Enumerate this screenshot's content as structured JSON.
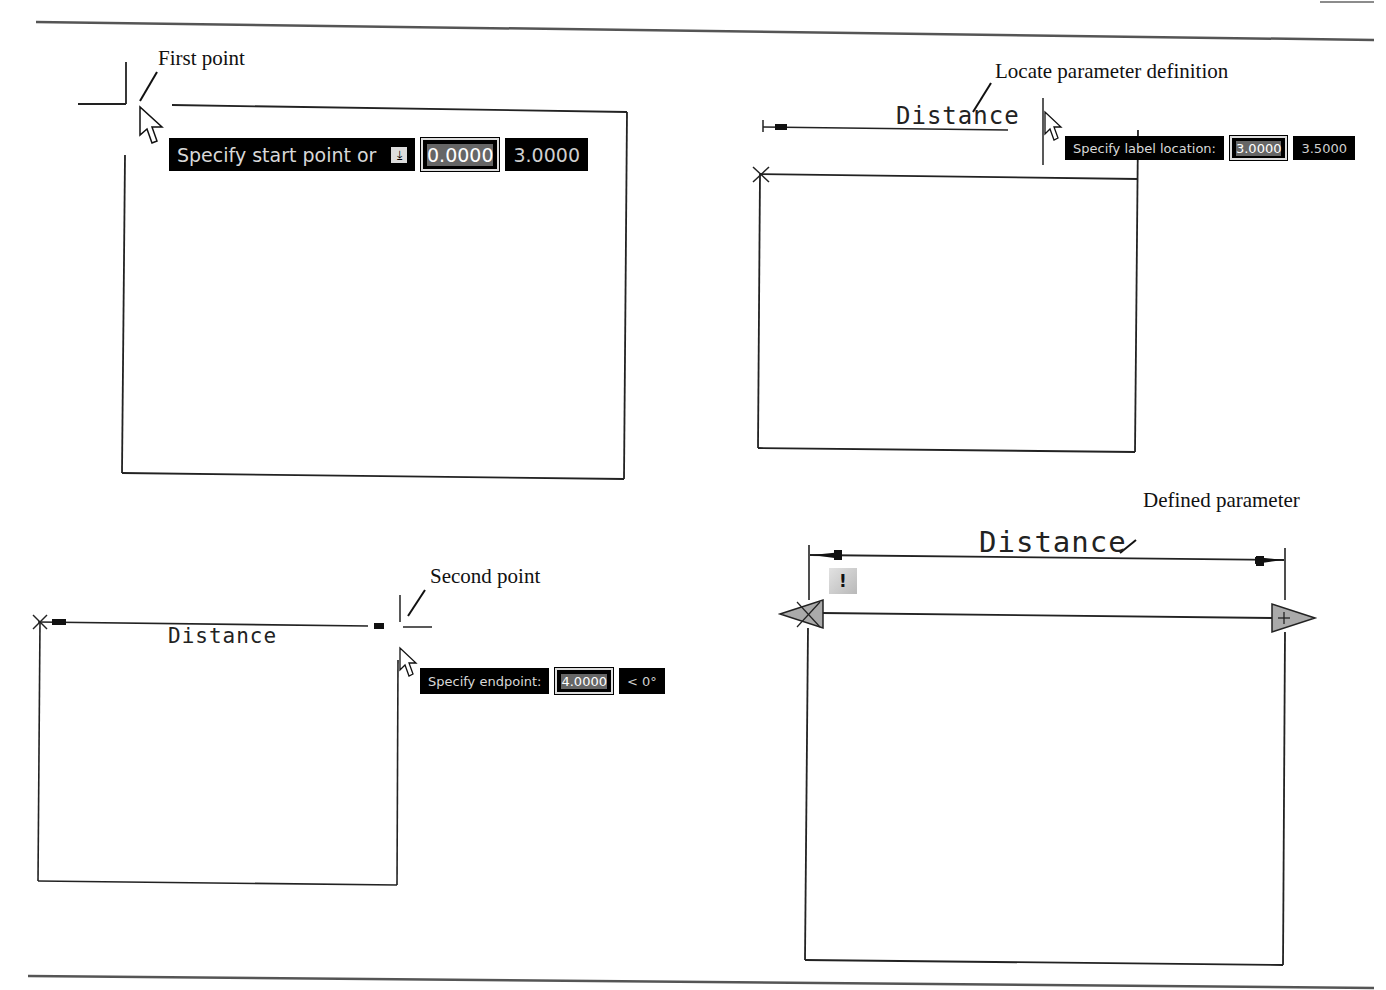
{
  "figure": {
    "panels": [
      {
        "id": "first-point",
        "callout": "First point",
        "tooltip": {
          "prompt": "Specify start point or",
          "dropdown_icon": "down-arrow-menu-icon",
          "input_value": "0.0000",
          "second_value": "3.0000"
        }
      },
      {
        "id": "locate-parameter",
        "callout": "Locate parameter definition",
        "label": "Distance",
        "tooltip": {
          "prompt": "Specify label location:",
          "input_value": "3.0000",
          "second_value": "3.5000"
        }
      },
      {
        "id": "second-point",
        "callout": "Second point",
        "label": "Distance",
        "tooltip": {
          "prompt": "Specify endpoint:",
          "input_value": "4.0000",
          "second_value": "< 0°"
        }
      },
      {
        "id": "defined-parameter",
        "callout": "Defined parameter",
        "label": "Distance",
        "alert_badge": "!"
      }
    ]
  }
}
